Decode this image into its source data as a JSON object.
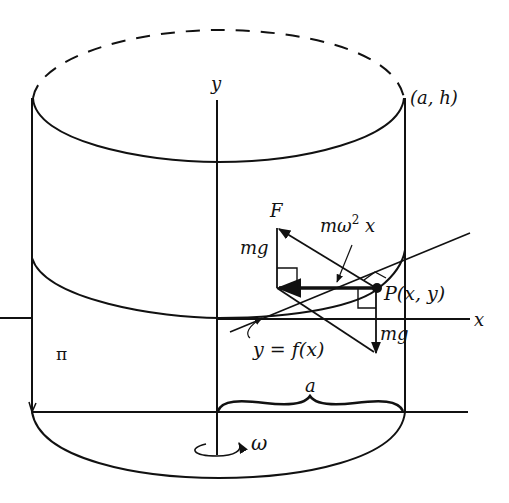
{
  "diagram": {
    "labels": {
      "y_axis": "y",
      "x_axis": "x",
      "corner_point": "(a, h)",
      "force_F": "F",
      "mg_left": "mg",
      "centripetal": "mω²x",
      "centripetal_m": "mω",
      "centripetal_exp": "2",
      "centripetal_x": " x",
      "point_P": "P(x, y)",
      "mg_right": "mg",
      "curve": "y = f(x)",
      "pi": "π",
      "radius": "a",
      "omega": "ω"
    },
    "colors": {
      "line": "#111111",
      "background": "#ffffff"
    }
  }
}
